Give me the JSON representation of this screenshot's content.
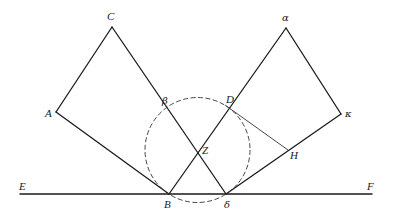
{
  "diagram": {
    "type": "geometric-construction",
    "colors": {
      "line": "#1a1a1a",
      "background": "#ffffff",
      "circle": "#333333"
    },
    "points": {
      "A": {
        "label": "A",
        "x": 56,
        "y": 112
      },
      "C": {
        "label": "C",
        "x": 112,
        "y": 27
      },
      "alpha": {
        "label": "α",
        "x": 286,
        "y": 28
      },
      "kappa": {
        "label": "κ",
        "x": 341,
        "y": 114
      },
      "beta": {
        "label": "β",
        "x": 170,
        "y": 106
      },
      "D": {
        "label": "D",
        "x": 225,
        "y": 105
      },
      "Z": {
        "label": "Z",
        "x": 197,
        "y": 150
      },
      "H": {
        "label": "H",
        "x": 288,
        "y": 150
      },
      "B": {
        "label": "B",
        "x": 169,
        "y": 194
      },
      "delta": {
        "label": "δ",
        "x": 226,
        "y": 194
      },
      "E": {
        "label": "E",
        "x": 20,
        "y": 194
      },
      "F": {
        "label": "F",
        "x": 372,
        "y": 194
      }
    },
    "labels": {
      "A": "A",
      "C": "C",
      "alpha": "α",
      "kappa": "κ",
      "beta": "β",
      "D": "D",
      "Z": "Z",
      "H": "H",
      "B": "B",
      "delta": "δ",
      "E": "E",
      "F": "F"
    },
    "circle": {
      "cx": 197.5,
      "cy": 150,
      "r": 52.5,
      "style": "dashed"
    },
    "segments": [
      "A-C",
      "C-D",
      "A-B",
      "alpha-kappa",
      "alpha-beta",
      "kappa-delta",
      "beta-delta",
      "D-B",
      "E-F"
    ],
    "thin_segments": [
      "D-H"
    ]
  }
}
